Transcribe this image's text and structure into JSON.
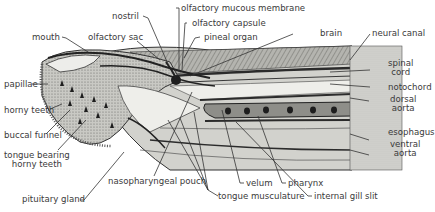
{
  "figure": {
    "labels": {
      "olfactory_mucous_membrane": "olfactory mucous membrane",
      "nostril": "nostril",
      "olfactory_capsule": "olfactory capsule",
      "mouth": "mouth",
      "olfactory_sac": "olfactory sac",
      "pineal_organ": "pineal organ",
      "brain": "brain",
      "neural_canal": "neural canal",
      "spinal_cord_1": "spinal",
      "spinal_cord_2": "cord",
      "notochord": "notochord",
      "dorsal_aorta_1": "dorsal",
      "dorsal_aorta_2": "aorta",
      "esophagus": "esophagus",
      "ventral_aorta_1": "ventral",
      "ventral_aorta_2": "aorta",
      "papillae": "papillae",
      "horny_teeth": "horny teeth",
      "buccal_funnel": "buccal funnel",
      "tongue_bearing_1": "tongue bearing",
      "tongue_bearing_2": "horny teeth",
      "pituitary_gland": "pituitary gland",
      "nasopharyngeal_pouch": "nasopharyngeal pouch",
      "velum": "velum",
      "pharynx": "pharynx",
      "tongue_musculature": "tongue musculature",
      "internal_gill_slit": "internal gill slit"
    },
    "colors": {
      "ink": "#2b2b2b",
      "tissue_light": "#e9e9e6",
      "tissue_mid": "#a9a9a4",
      "tissue_dark": "#4a4a46",
      "label": "#3a3a3a"
    }
  }
}
